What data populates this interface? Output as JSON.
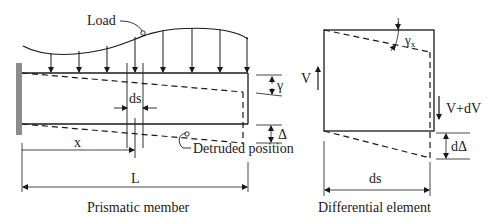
{
  "figure": {
    "left_panel": {
      "caption": "Prismatic member",
      "load_label": "Load",
      "ds_label": "ds",
      "x_label": "x",
      "L_label": "L",
      "gamma_label": "γ",
      "delta_label": "Δ",
      "deflected_label": "Detruded position"
    },
    "right_panel": {
      "caption": "Differential element",
      "gamma_x_label": "γ",
      "gamma_x_sub": "x",
      "V_label": "V",
      "V_dV_label": "V+dV",
      "dDelta_label": "dΔ",
      "ds_label": "ds"
    },
    "colors": {
      "line": "#1a1a1a",
      "wall": "#8c8c8c"
    }
  }
}
